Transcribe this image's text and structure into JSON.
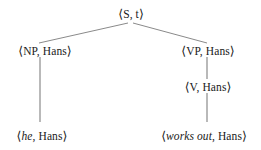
{
  "figure": {
    "type": "syntax-tree",
    "background_color": "#ffffff",
    "text_color": "#1a1a1a",
    "edge_color": "#8a8a8a"
  },
  "nodes": {
    "root": {
      "open": "⟨",
      "category": "S",
      "separator": ", ",
      "value": "t",
      "close": "⟩",
      "full_text": "⟨S, t⟩"
    },
    "np": {
      "open": "⟨",
      "category": "NP",
      "separator": ", ",
      "value": "Hans",
      "close": "⟩",
      "full_text": "⟨NP, Hans⟩"
    },
    "vp": {
      "open": "⟨",
      "category": "VP",
      "separator": ", ",
      "value": "Hans",
      "close": "⟩",
      "full_text": "⟨VP, Hans⟩"
    },
    "v": {
      "open": "⟨",
      "category": "V",
      "separator": ", ",
      "value": "Hans",
      "close": "⟩",
      "full_text": "⟨V, Hans⟩"
    },
    "leaf_he": {
      "open": "⟨",
      "word": "he",
      "separator": ", ",
      "value": "Hans",
      "close": "⟩",
      "full_text": "⟨he, Hans⟩"
    },
    "leaf_works_out": {
      "open": "⟨",
      "word": "works out",
      "separator": ", ",
      "value": "Hans",
      "close": "⟩",
      "full_text": "⟨works out, Hans⟩"
    }
  },
  "edges": [
    {
      "name": "root-to-np",
      "from": "root",
      "to": "np",
      "x1": 128,
      "y1": 23,
      "x2": 39,
      "y2": 43
    },
    {
      "name": "root-to-vp",
      "from": "root",
      "to": "vp",
      "x1": 133,
      "y1": 23,
      "x2": 207,
      "y2": 43
    },
    {
      "name": "np-to-he",
      "from": "np",
      "to": "leaf_he",
      "x1": 40,
      "y1": 57,
      "x2": 40,
      "y2": 122
    },
    {
      "name": "vp-to-v",
      "from": "vp",
      "to": "v",
      "x1": 207,
      "y1": 57,
      "x2": 207,
      "y2": 79
    },
    {
      "name": "v-to-worksout",
      "from": "v",
      "to": "leaf_works_out",
      "x1": 207,
      "y1": 93,
      "x2": 207,
      "y2": 122
    }
  ]
}
